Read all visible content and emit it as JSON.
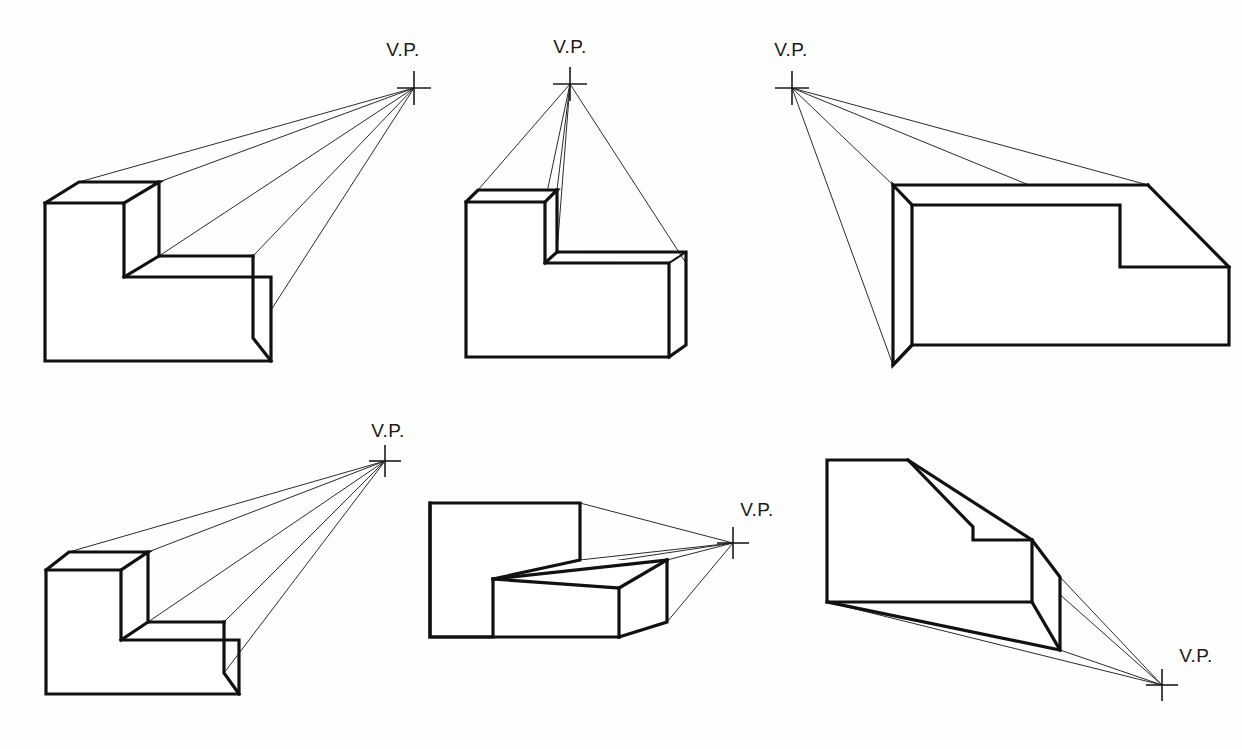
{
  "sheet": {
    "title": "One-Point Perspective Construction Exercises",
    "background_color": "#fefefe",
    "ink_color": "#111111",
    "width": 1242,
    "height": 749
  },
  "labels": {
    "vanishing_point": "V.P."
  },
  "figures": [
    {
      "id": "fig-1",
      "name": "top-left-figure",
      "vp_label": "V.P.",
      "vp_label_text": "V.P.",
      "vp": {
        "x": 414,
        "y": 88
      },
      "vp_label_pos": {
        "x": 403,
        "y": 56,
        "anchor": "middle"
      },
      "vp_cross_arm": 17,
      "description": "L-block, viewpoint high and far right, seen from above-left",
      "faces": [
        {
          "name": "front-L-face",
          "points": "45,203 124,203 124,277 271,277 271,361 45,361"
        },
        {
          "name": "top-upper-slab",
          "points": "45,203 79,182 159,182 124,203"
        },
        {
          "name": "top-upper-right",
          "points": "124,203 159,182 159,256 124,277"
        },
        {
          "name": "top-lower-slab",
          "points": "124,277 159,256 253,256 271,277"
        },
        {
          "name": "side-right-face",
          "points": "271,277 253,256 253,338 271,361"
        }
      ],
      "edges": [
        "M45,203 L124,203 L124,277 L271,277 L271,361 L45,361 Z",
        "M45,203 L79,182 L159,182 L124,203",
        "M159,182 L159,256",
        "M124,277 L159,256 L253,256",
        "M253,256 L253,338 L271,361",
        "M159,256 L253,256"
      ],
      "projection_lines": [
        {
          "from": "79,182",
          "to": "414,88"
        },
        {
          "from": "159,182",
          "to": "414,88"
        },
        {
          "from": "159,256",
          "to": "414,88"
        },
        {
          "from": "253,256",
          "to": "414,88"
        },
        {
          "from": "253,338",
          "to": "414,88"
        }
      ]
    },
    {
      "id": "fig-2",
      "name": "top-center-figure",
      "vp_label": "V.P.",
      "vp_label_text": "V.P.",
      "vp": {
        "x": 570,
        "y": 84
      },
      "vp_label_pos": {
        "x": 570,
        "y": 53,
        "anchor": "middle"
      },
      "vp_cross_arm": 17,
      "description": "L-block, viewpoint directly above center, seen from below",
      "faces": [
        {
          "name": "front-L-face",
          "points": "466,202 490,202 490,275 573,275 573,357 466,357"
        },
        {
          "name": "top-upper-slab",
          "points": "466,202 478,190 557,190 545,202"
        },
        {
          "name": "top-lower-slab",
          "points": "490,275 545,263 650,263 669,275"
        },
        {
          "name": "right-face",
          "points": "573,275 669,275 669,357 573,357"
        }
      ],
      "edges": [
        "M466,202 L545,202 L545,263 L669,275 L669,357 L466,357 Z",
        "M466,202 L478,190 L557,190 L545,202",
        "M557,190 L557,252",
        "M545,263 L557,252 L686,263",
        "M686,263 L686,275",
        "M545,202 L545,263",
        "M669,275 L686,263"
      ],
      "projection_lines": [
        {
          "from": "478,190",
          "to": "570,84"
        },
        {
          "from": "557,190",
          "to": "570,84"
        },
        {
          "from": "557,252",
          "to": "570,84"
        },
        {
          "from": "545,202",
          "to": "570,84"
        },
        {
          "from": "686,263",
          "to": "570,84"
        }
      ]
    },
    {
      "id": "fig-3",
      "name": "top-right-figure",
      "vp_label": "V.P.",
      "vp_label_text": "V.P.",
      "vp": {
        "x": 792,
        "y": 88
      },
      "vp_label_pos": {
        "x": 791,
        "y": 56,
        "anchor": "middle"
      },
      "vp_cross_arm": 17,
      "description": "L-block, viewpoint high and far left, seen from above-right",
      "faces": [
        {
          "name": "left-side-face",
          "points": "893,185 912,205 912,345 893,365"
        },
        {
          "name": "front-L-face",
          "points": "912,205 1120,205 1120,267 1188,267 1188,345 912,345"
        },
        {
          "name": "top-slab",
          "points": "893,185 1148,185 1120,205 912,205"
        },
        {
          "name": "step-top",
          "points": "1120,267 1222,267 1188,267"
        }
      ],
      "edges": [
        "M893,185 L912,205 L912,345 L893,365 Z",
        "M893,185 L1148,185",
        "M912,205 L1120,205 L1120,267 L1229,267 L1229,345 L912,345",
        "M1148,185 L1229,267",
        "M893,365 L912,345"
      ],
      "projection_lines": [
        {
          "from": "1148,185",
          "to": "792,88"
        },
        {
          "from": "1229,267",
          "to": "792,88"
        },
        {
          "from": "893,185",
          "to": "792,88"
        },
        {
          "from": "893,365",
          "to": "792,88"
        }
      ]
    },
    {
      "id": "fig-4",
      "name": "bottom-left-figure",
      "vp_label": "V.P.",
      "vp_label_text": "V.P.",
      "vp": {
        "x": 385,
        "y": 461
      },
      "vp_label_pos": {
        "x": 388,
        "y": 437,
        "anchor": "middle"
      },
      "vp_cross_arm": 16,
      "description": "L-block, viewpoint upper right, similar to figure 1",
      "faces": [
        {
          "name": "front-L-face",
          "points": "46,570 121,570 121,640 239,640 239,694 46,694"
        },
        {
          "name": "top-upper-slab",
          "points": "46,570 69,552 148,552 121,570"
        },
        {
          "name": "top-lower-slab",
          "points": "121,640 148,622 224,622 239,640"
        },
        {
          "name": "right-face",
          "points": "239,640 224,622 224,673 239,694"
        }
      ],
      "edges": [
        "M46,570 L121,570 L121,640 L239,640 L239,694 L46,694 Z",
        "M46,570 L69,552 L148,552 L121,570",
        "M148,552 L148,622",
        "M121,640 L148,622 L224,622",
        "M224,622 L224,673 L239,694"
      ],
      "projection_lines": [
        {
          "from": "69,552",
          "to": "385,461"
        },
        {
          "from": "148,552",
          "to": "385,461"
        },
        {
          "from": "148,622",
          "to": "385,461"
        },
        {
          "from": "224,622",
          "to": "385,461"
        },
        {
          "from": "224,673",
          "to": "385,461"
        }
      ]
    },
    {
      "id": "fig-5",
      "name": "bottom-center-figure",
      "vp_label": "V.P.",
      "vp_label_text": "V.P.",
      "vp": {
        "x": 733,
        "y": 543
      },
      "vp_label_pos": {
        "x": 757,
        "y": 516,
        "anchor": "middle"
      },
      "vp_cross_arm": 16,
      "description": "L-block, viewpoint to the right at mid height",
      "faces": [
        {
          "name": "front-L-face",
          "points": "430,503 493,503 493,579 619,579 619,637 430,637"
        },
        {
          "name": "top-slab",
          "points": "430,503 580,503 580,560 493,579"
        },
        {
          "name": "step-top",
          "points": "493,579 580,560 667,570 619,588"
        },
        {
          "name": "right-face",
          "points": "619,588 667,570 667,622 619,637"
        }
      ],
      "edges": [
        "M430,503 L580,503 L580,560 L493,579 L493,637 L430,637 Z",
        "M430,503 L430,637 L619,637",
        "M493,579 L667,560",
        "M580,503 L580,560",
        "M667,560 L667,622 L619,637",
        "M493,579 L619,588",
        "M619,588 L667,560"
      ],
      "projection_lines": [
        {
          "from": "580,503",
          "to": "733,543"
        },
        {
          "from": "580,560",
          "to": "733,543"
        },
        {
          "from": "667,560",
          "to": "733,543"
        },
        {
          "from": "667,622",
          "to": "733,543"
        }
      ]
    },
    {
      "id": "fig-6",
      "name": "bottom-right-figure",
      "vp_label": "V.P.",
      "vp_label_text": "V.P.",
      "vp": {
        "x": 1162,
        "y": 685
      },
      "vp_label_pos": {
        "x": 1192,
        "y": 662,
        "anchor": "middle"
      },
      "vp_cross_arm": 16,
      "description": "L-block, viewpoint low and far right, seen from above",
      "faces": [
        {
          "name": "front-L-face",
          "points": "827,460 908,460 908,540 1032,540 1032,602 827,602"
        },
        {
          "name": "top-upper-slab",
          "points": "908,460 973,527 973,540 908,540"
        },
        {
          "name": "step-top",
          "points": "1032,540 1063,540 1063,602 1032,602"
        },
        {
          "name": "bottom-slab",
          "points": "827,602 1060,650 1060,602"
        }
      ],
      "edges": [
        "M827,460 L908,460 L973,527 L973,540 L1032,540 L1032,602 L827,602 Z",
        "M908,460 L1032,540",
        "M973,527 L973,540",
        "M1032,540 L1060,577 L1060,650 L827,602",
        "M1032,602 L1060,650",
        "M827,602 L1060,650"
      ],
      "projection_lines": [
        {
          "from": "908,460",
          "to": "1162,685"
        },
        {
          "from": "1060,577",
          "to": "1162,685"
        },
        {
          "from": "1060,650",
          "to": "1162,685"
        },
        {
          "from": "827,602",
          "to": "1162,685"
        }
      ]
    }
  ]
}
